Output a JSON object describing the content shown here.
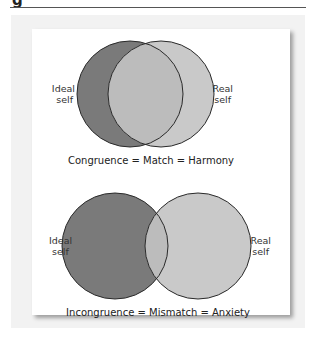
{
  "figure": {
    "label_fragment": "g"
  },
  "diagrams": [
    {
      "id": "congruence",
      "left_label_line1": "Ideal",
      "left_label_line2": "self",
      "right_label_line1": "Real",
      "right_label_line2": "self",
      "caption": "Congruence = Match = Harmony",
      "overlap": "large"
    },
    {
      "id": "incongruence",
      "left_label_line1": "Ideal",
      "left_label_line2": "self",
      "right_label_line1": "Real",
      "right_label_line2": "self",
      "caption": "Incongruence = Mismatch = Anxiety",
      "overlap": "small"
    }
  ],
  "colors": {
    "ideal_circle": "#7a7a7a",
    "real_circle": "#c8c8c8",
    "overlap": "#bdbdbd",
    "outline": "#2a2a2a",
    "panel": "#f2f2f2",
    "card": "#ffffff"
  }
}
